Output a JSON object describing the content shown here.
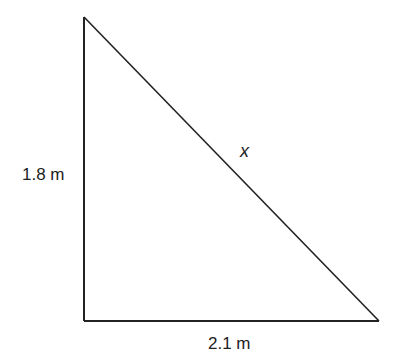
{
  "diagram": {
    "type": "right-triangle",
    "vertical_side": {
      "label": "1.8 m",
      "value": 1.8,
      "unit": "m"
    },
    "horizontal_side": {
      "label": "2.1 m",
      "value": 2.1,
      "unit": "m"
    },
    "hypotenuse": {
      "label": "x"
    },
    "colors": {
      "stroke": "#222222",
      "text": "#222222",
      "background": "#ffffff"
    }
  }
}
